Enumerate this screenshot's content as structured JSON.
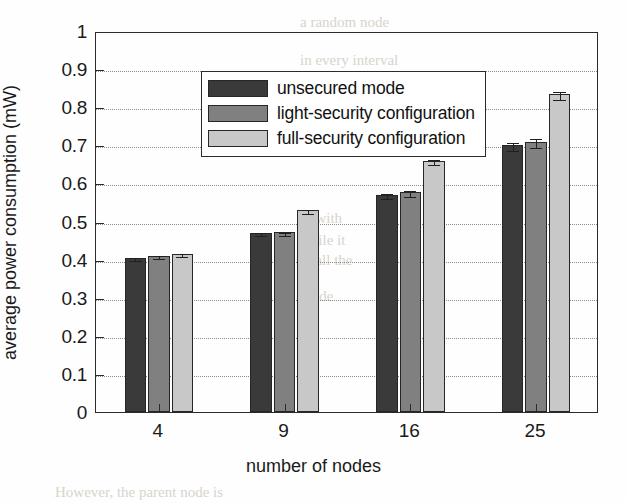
{
  "chart_data": {
    "type": "bar",
    "title": "",
    "xlabel": "number of nodes",
    "ylabel": "average power consumption (mW)",
    "categories": [
      "4",
      "9",
      "16",
      "25"
    ],
    "ylim": [
      0,
      1
    ],
    "ytick_labels": [
      "0",
      "0.1",
      "0.2",
      "0.3",
      "0.4",
      "0.5",
      "0.6",
      "0.7",
      "0.8",
      "0.9",
      "1"
    ],
    "ytick_values": [
      0,
      0.1,
      0.2,
      0.3,
      0.4,
      0.5,
      0.6,
      0.7,
      0.8,
      0.9,
      1
    ],
    "grid": "horizontal-dotted",
    "legend_position": "upper-left",
    "series": [
      {
        "name": "unsecured mode",
        "color": "#3a3a3a",
        "values": [
          0.405,
          0.47,
          0.57,
          0.7
        ],
        "errors": [
          0.004,
          0.004,
          0.007,
          0.01
        ]
      },
      {
        "name": "light-security configuration",
        "color": "#808080",
        "values": [
          0.41,
          0.472,
          0.578,
          0.71
        ],
        "errors": [
          0.004,
          0.004,
          0.008,
          0.012
        ]
      },
      {
        "name": "full-security configuration",
        "color": "#c8c8c8",
        "values": [
          0.415,
          0.53,
          0.66,
          0.835
        ],
        "errors": [
          0.004,
          0.005,
          0.007,
          0.011
        ]
      }
    ]
  },
  "background_text": [
    {
      "text": "a random node",
      "x": 300,
      "y": 14
    },
    {
      "text": "in every interval",
      "x": 300,
      "y": 52
    },
    {
      "text": "in with",
      "x": 300,
      "y": 210
    },
    {
      "text": "while it",
      "x": 300,
      "y": 232
    },
    {
      "text": "to all the",
      "x": 300,
      "y": 252
    },
    {
      "text": "mode",
      "x": 300,
      "y": 288
    },
    {
      "text": "However, the parent node is",
      "x": 55,
      "y": 484
    }
  ]
}
